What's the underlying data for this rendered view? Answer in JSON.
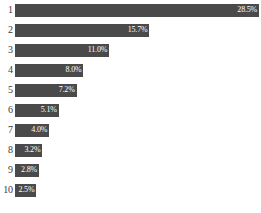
{
  "chart_data": {
    "type": "bar",
    "orientation": "horizontal",
    "title": "",
    "subtitle": "",
    "xlabel": "",
    "ylabel": "",
    "grid": false,
    "legend": null,
    "axis_visible": false,
    "xlim": [
      0,
      28.5
    ],
    "categories": [
      "1",
      "2",
      "3",
      "4",
      "5",
      "6",
      "7",
      "8",
      "9",
      "10"
    ],
    "values": [
      28.5,
      15.7,
      11.0,
      8.0,
      7.2,
      5.1,
      4.0,
      3.2,
      2.8,
      2.5
    ],
    "value_labels": [
      "28.5%",
      "15.7%",
      "11.0%",
      "8.0%",
      "7.2%",
      "5.1%",
      "4.0%",
      "3.2%",
      "2.8%",
      "2.5%"
    ],
    "value_unit": "%",
    "bar_color": "#4a4a4a",
    "value_label_color": "#ffffff",
    "category_label_color": "#3a3a3a",
    "background_color": "#ffffff"
  }
}
